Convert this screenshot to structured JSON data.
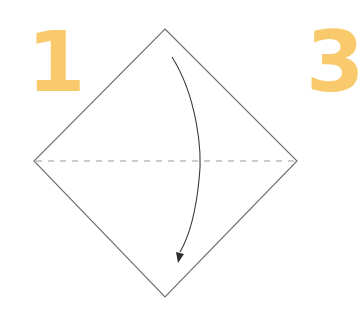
{
  "steps": {
    "current": {
      "number": "1"
    },
    "next_partial": {
      "number": "3"
    }
  },
  "diagram": {
    "shape": "square-on-point",
    "vertices": {
      "top": [
        165,
        29
      ],
      "left": [
        34,
        161
      ],
      "right": [
        297,
        161
      ],
      "bottom": [
        165,
        297
      ]
    },
    "fold_line": {
      "style": "valley-fold-dashed",
      "from": [
        34,
        161
      ],
      "to": [
        297,
        161
      ]
    },
    "fold_arrow": {
      "direction": "top-corner-down-to-bottom",
      "start": [
        172,
        57
      ],
      "end": [
        179,
        260
      ]
    }
  },
  "colors": {
    "background": "#ffffff",
    "step_number": "#f8ca6c",
    "outline": "#6e6e6e",
    "fold_line": "#9a9aa2",
    "arrow": "#3a3a3a"
  }
}
